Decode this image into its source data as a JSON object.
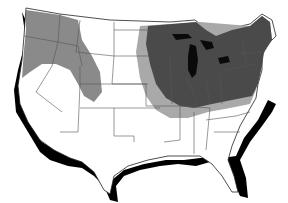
{
  "map": {
    "region": "Contiguous United States",
    "style": "grayscale shaded region map",
    "colors": {
      "background": "#ffffff",
      "land": "#ffffff",
      "coast_shadow": "#000000",
      "state_border": "#555555",
      "zone_medium": "#8a8a8a",
      "zone_dark": "#4a4a4a",
      "zone_light": "#a9a9a9",
      "lakes": "#0a0a0a"
    },
    "zones": [
      {
        "id": "northwest",
        "shade": "medium",
        "description": "Pacific Northwest extending south along Rockies"
      },
      {
        "id": "northeast-core",
        "shade": "dark",
        "description": "Upper Midwest, Great Lakes and Northeast"
      },
      {
        "id": "northeast-fringe",
        "shade": "light",
        "description": "Transition band around dark zone"
      }
    ]
  }
}
